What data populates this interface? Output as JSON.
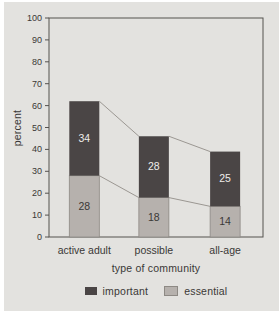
{
  "figure": {
    "page_bg": "#ffffff",
    "panel_bg": "#e3e2df",
    "frame_color": "#55524f",
    "tick_text_color": "#3a3836",
    "connector_color": "#9b9792",
    "light_outline_color": "#8d8984"
  },
  "chart_data": {
    "type": "bar",
    "stacked": true,
    "title": "",
    "xlabel": "type of community",
    "ylabel": "percent",
    "ylim": [
      0,
      100
    ],
    "ytick_step": 10,
    "yticks": [
      0,
      10,
      20,
      30,
      40,
      50,
      60,
      70,
      80,
      90,
      100
    ],
    "grid": false,
    "categories": [
      "active adult",
      "possible",
      "all-age"
    ],
    "series": [
      {
        "name": "essential",
        "values": [
          28,
          18,
          14
        ],
        "color": "#b6b1ad",
        "label_color": "#3a3836",
        "outlined": true
      },
      {
        "name": "important",
        "values": [
          34,
          28,
          25
        ],
        "color": "#4a4545",
        "label_color": "#efedea",
        "outlined": false
      }
    ],
    "stack_totals": [
      62,
      46,
      39
    ],
    "legend": [
      {
        "label": "important",
        "color": "#4a4545",
        "outlined": false
      },
      {
        "label": "essential",
        "color": "#b6b1ad",
        "outlined": true
      }
    ],
    "legend_position": "bottom",
    "connector_lines": true
  }
}
